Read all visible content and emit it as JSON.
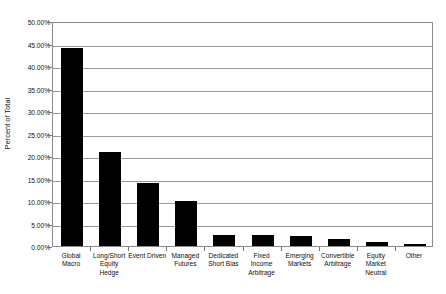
{
  "chart_data": {
    "type": "bar",
    "title": "",
    "subtitle": "",
    "xlabel": "",
    "ylabel": "Percent of Total",
    "ylim": [
      0,
      50
    ],
    "ytick_step": 5,
    "ytick_labels": [
      "50.00%",
      "45.00%",
      "40.00%",
      "35.00%",
      "30.00%",
      "25.00%",
      "20.00%",
      "15.00%",
      "10.00%",
      "5.00%",
      "0.00%"
    ],
    "ytick_values": [
      50,
      45,
      40,
      35,
      30,
      25,
      20,
      15,
      10,
      5,
      0
    ],
    "categories": [
      "Global Macro",
      "Long/Short Equity Hedge",
      "Event Driven",
      "Managed Futures",
      "Dedicated Short Bias",
      "Fixed Income Arbitrage",
      "Emerging Markets",
      "Convertible Arbitrage",
      "Equity Market Neutral",
      "Other"
    ],
    "values": [
      44.0,
      21.0,
      14.0,
      10.0,
      2.5,
      2.5,
      2.3,
      1.5,
      0.8,
      0.4
    ],
    "value_labels": [
      "44.00%",
      "21.00%",
      "14.00%",
      "10.00%",
      "2.50%",
      "2.50%",
      "2.30%",
      "1.50%",
      "0.80%",
      "0.40%"
    ],
    "grid": true,
    "grid_axis": "y",
    "legend": false,
    "legend_position": "none",
    "bar_color": "#000000",
    "plot_border_color": "#8a8a8a",
    "gridline_color": "#9a9a9a",
    "background_color": "#ffffff",
    "annotations": []
  },
  "axis": {
    "y_title": "Percent of Total"
  }
}
